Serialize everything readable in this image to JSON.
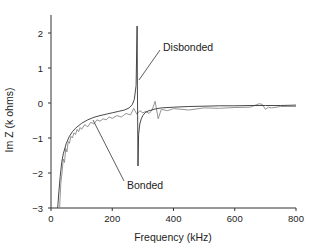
{
  "chart_data": {
    "type": "line",
    "title": "",
    "xlabel": "Frequency (kHz)",
    "ylabel": "Im Z (k ohms)",
    "xlim": [
      0,
      800
    ],
    "ylim": [
      -3,
      2.5
    ],
    "xticks": [
      0,
      200,
      400,
      600,
      800
    ],
    "xtick_labels": [
      "0",
      "200",
      "400",
      "600",
      "800"
    ],
    "yticks": [
      2,
      1,
      0,
      -1,
      -2,
      -3
    ],
    "ytick_labels": [
      "2",
      "1",
      "0",
      "−1",
      "−2",
      "−3"
    ],
    "grid": false,
    "legend": "none (inline annotations)",
    "series": [
      {
        "name": "Disbonded",
        "color": "#333333",
        "x": [
          22,
          25,
          30,
          35,
          40,
          50,
          60,
          70,
          80,
          100,
          120,
          140,
          160,
          180,
          200,
          220,
          240,
          255,
          265,
          272,
          278,
          281,
          282,
          284,
          286,
          290,
          295,
          300,
          310,
          320,
          340,
          360,
          400,
          450,
          500,
          550,
          600,
          650,
          700,
          750,
          800
        ],
        "y": [
          -3.0,
          -2.6,
          -2.1,
          -1.7,
          -1.45,
          -1.15,
          -0.95,
          -0.82,
          -0.72,
          -0.58,
          -0.48,
          -0.41,
          -0.36,
          -0.32,
          -0.28,
          -0.24,
          -0.2,
          -0.14,
          -0.05,
          0.1,
          0.5,
          2.2,
          0.5,
          -1.8,
          -0.9,
          -0.6,
          -0.45,
          -0.35,
          -0.26,
          -0.22,
          -0.17,
          -0.14,
          -0.12,
          -0.1,
          -0.09,
          -0.08,
          -0.08,
          -0.07,
          -0.07,
          -0.07,
          -0.06
        ]
      },
      {
        "name": "Bonded",
        "color": "#888888",
        "x": [
          28,
          32,
          36,
          40,
          44,
          48,
          52,
          56,
          60,
          65,
          70,
          75,
          80,
          85,
          90,
          95,
          100,
          110,
          120,
          130,
          140,
          150,
          160,
          170,
          180,
          190,
          200,
          215,
          230,
          245,
          260,
          270,
          280,
          290,
          300,
          310,
          320,
          330,
          340,
          350,
          360,
          380,
          400,
          450,
          500,
          550,
          600,
          650,
          680,
          690,
          700,
          710,
          720,
          750,
          800
        ],
        "y": [
          -3.0,
          -2.3,
          -2.0,
          -1.6,
          -1.7,
          -1.3,
          -1.4,
          -1.1,
          -1.15,
          -0.95,
          -1.0,
          -0.85,
          -0.9,
          -0.75,
          -0.82,
          -0.7,
          -0.75,
          -0.62,
          -0.68,
          -0.55,
          -0.6,
          -0.48,
          -0.52,
          -0.45,
          -0.48,
          -0.4,
          -0.44,
          -0.36,
          -0.4,
          -0.3,
          -0.34,
          -0.15,
          -0.32,
          -0.22,
          -0.28,
          -0.24,
          -0.3,
          -0.2,
          0.05,
          -0.45,
          -0.18,
          -0.22,
          -0.16,
          -0.2,
          -0.14,
          -0.15,
          -0.13,
          -0.12,
          -0.02,
          -0.04,
          -0.18,
          -0.12,
          -0.14,
          -0.1,
          -0.1
        ]
      }
    ],
    "annotations": [
      {
        "text": "Disbonded",
        "x_px": 163,
        "y_px": 51,
        "arrow_to_px": [
          139,
          80
        ]
      },
      {
        "text": "Bonded",
        "x_px": 127,
        "y_px": 189,
        "arrow_to_px": [
          93,
          120
        ]
      }
    ]
  }
}
